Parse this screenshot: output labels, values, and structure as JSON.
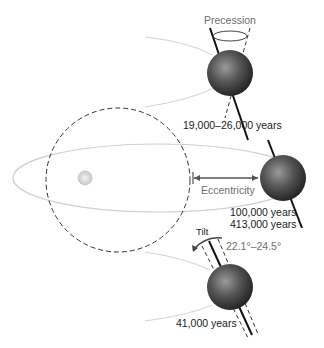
{
  "diagram": {
    "labels": {
      "precession": "Precession",
      "precession_period": "19,000–26,000 years",
      "eccentricity": "Eccentricity",
      "eccentricity_period_1": "100,000 years",
      "eccentricity_period_2": "413,000 years",
      "tilt": "Tilt",
      "tilt_range": "22.1°–24.5°",
      "tilt_period": "41,000 years"
    },
    "elements": [
      "sun",
      "earth-precession",
      "earth-eccentricity",
      "earth-tilt",
      "elliptical-orbit",
      "circular-orbit"
    ],
    "colors": {
      "orbit": "#cfcfcf",
      "label_gray": "#6e6e6e",
      "label_dark": "#1a1a1a",
      "earth": "#4a4a4a"
    }
  }
}
